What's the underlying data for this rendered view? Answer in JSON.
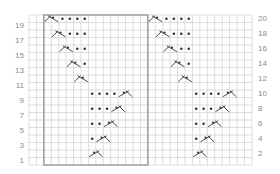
{
  "chart": {
    "title": "",
    "grid": {
      "cols": 30,
      "rows": 20,
      "left": 29,
      "top": 15,
      "cell_w": 7.43,
      "cell_h": 7.5
    },
    "colors": {
      "grid_line": "#d4d4d4",
      "box_line": "#8c8c8c",
      "symbol": "#333333",
      "label": "#8a8a8a"
    },
    "repeat_box": {
      "col_start": 2,
      "col_end": 16,
      "row_start": 0,
      "row_end": 20
    },
    "left_labels": [
      "19",
      "17",
      "15",
      "13",
      "11",
      "9",
      "7",
      "5",
      "3",
      "1"
    ],
    "right_labels": [
      "20",
      "18",
      "16",
      "14",
      "12",
      "10",
      "8",
      "6",
      "4",
      "2"
    ],
    "repeat_offsets": [
      0,
      14
    ],
    "stitches": [
      {
        "row": 20,
        "cross": "left",
        "cross_col": 2,
        "dots": [
          4,
          5,
          6,
          7
        ]
      },
      {
        "row": 18,
        "cross": "left",
        "cross_col": 3,
        "dots": [
          5,
          6,
          7
        ]
      },
      {
        "row": 16,
        "cross": "left",
        "cross_col": 4,
        "dots": [
          6,
          7
        ]
      },
      {
        "row": 14,
        "cross": "left",
        "cross_col": 5,
        "dots": [
          7
        ]
      },
      {
        "row": 12,
        "cross": "left",
        "cross_col": 6,
        "dots": []
      },
      {
        "row": 10,
        "cross": "right",
        "cross_col": 12,
        "dots": [
          8,
          9,
          10,
          11
        ]
      },
      {
        "row": 8,
        "cross": "right",
        "cross_col": 11,
        "dots": [
          8,
          9,
          10
        ]
      },
      {
        "row": 6,
        "cross": "right",
        "cross_col": 10,
        "dots": [
          8,
          9
        ]
      },
      {
        "row": 4,
        "cross": "right",
        "cross_col": 9,
        "dots": [
          8
        ]
      },
      {
        "row": 2,
        "cross": "right",
        "cross_col": 8,
        "dots": []
      }
    ],
    "legend": {
      "dot": "purl-stitch-icon",
      "left_cross": "left-cable-cross-icon",
      "right_cross": "right-cable-cross-icon"
    }
  }
}
